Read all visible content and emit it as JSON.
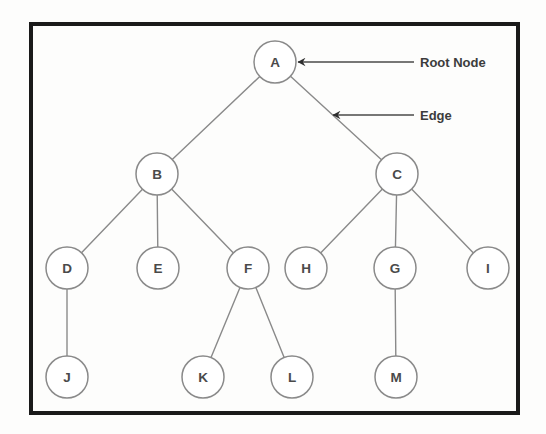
{
  "figure": {
    "background_color": "#fdfdfc",
    "border_color": "#1a1a1a",
    "node_stroke_color": "#8a8a8a",
    "node_fill_color": "#ffffff",
    "edge_color": "#8a8a8a",
    "label_color": "#4a4a4a",
    "annotation_color": "#3c3c3c"
  },
  "border": {
    "x": 31,
    "y": 24,
    "width": 487,
    "height": 389,
    "stroke_width": 4
  },
  "node_radius": 21,
  "nodes": [
    {
      "id": "A",
      "label": "A",
      "cx": 275,
      "cy": 62,
      "level": 0
    },
    {
      "id": "B",
      "label": "B",
      "cx": 157,
      "cy": 174,
      "level": 1
    },
    {
      "id": "C",
      "label": "C",
      "cx": 397,
      "cy": 174,
      "level": 1
    },
    {
      "id": "D",
      "label": "D",
      "cx": 67,
      "cy": 268,
      "level": 2
    },
    {
      "id": "E",
      "label": "E",
      "cx": 158,
      "cy": 268,
      "level": 2
    },
    {
      "id": "F",
      "label": "F",
      "cx": 248,
      "cy": 268,
      "level": 2
    },
    {
      "id": "H",
      "label": "H",
      "cx": 306,
      "cy": 268,
      "level": 2
    },
    {
      "id": "G",
      "label": "G",
      "cx": 395,
      "cy": 268,
      "level": 2
    },
    {
      "id": "I",
      "label": "I",
      "cx": 488,
      "cy": 268,
      "level": 2
    },
    {
      "id": "J",
      "label": "J",
      "cx": 67,
      "cy": 377,
      "level": 3
    },
    {
      "id": "K",
      "label": "K",
      "cx": 203,
      "cy": 377,
      "level": 3
    },
    {
      "id": "L",
      "label": "L",
      "cx": 292,
      "cy": 377,
      "level": 3
    },
    {
      "id": "M",
      "label": "M",
      "cx": 396,
      "cy": 377,
      "level": 3
    }
  ],
  "edges": [
    {
      "from": "A",
      "to": "B"
    },
    {
      "from": "A",
      "to": "C"
    },
    {
      "from": "B",
      "to": "D"
    },
    {
      "from": "B",
      "to": "E"
    },
    {
      "from": "B",
      "to": "F"
    },
    {
      "from": "C",
      "to": "H"
    },
    {
      "from": "C",
      "to": "G"
    },
    {
      "from": "C",
      "to": "I"
    },
    {
      "from": "D",
      "to": "J"
    },
    {
      "from": "F",
      "to": "K"
    },
    {
      "from": "F",
      "to": "L"
    },
    {
      "from": "G",
      "to": "M"
    }
  ],
  "annotations": [
    {
      "id": "root-node",
      "text": "Root Node",
      "arrow_x1": 414,
      "arrow_y1": 62,
      "arrow_x2": 298,
      "arrow_y2": 62,
      "text_x": 420,
      "text_y": 62
    },
    {
      "id": "edge",
      "text": "Edge",
      "arrow_x1": 414,
      "arrow_y1": 115,
      "arrow_x2": 333,
      "arrow_y2": 115,
      "text_x": 420,
      "text_y": 115
    }
  ]
}
